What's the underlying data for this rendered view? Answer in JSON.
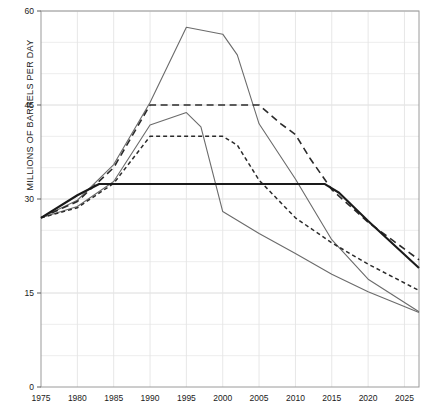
{
  "chart_data": {
    "type": "line",
    "title": "",
    "xlabel": "",
    "ylabel": "MILLIONS OF BARRELS PER DAY",
    "xlim": [
      1975,
      2027
    ],
    "ylim": [
      0,
      60
    ],
    "yticks": [
      0,
      15,
      30,
      45,
      60
    ],
    "ytick_labels": [
      "0",
      "15",
      "30",
      "45",
      "60"
    ],
    "yminor_step": 5,
    "xticks": [
      1975,
      1980,
      1985,
      1990,
      1995,
      2000,
      2005,
      2010,
      2015,
      2020,
      2025
    ],
    "xtick_labels": [
      "1975",
      "1980",
      "1985",
      "1990",
      "1995",
      "2000",
      "2005",
      "2010",
      "2015",
      "2020",
      "2025"
    ],
    "grid": true,
    "legend": "none",
    "units": "million barrels per day",
    "series": [
      {
        "name": "high-solid-peak-1995",
        "style": "solid",
        "color": "#6b6b6b",
        "width": 1.1,
        "x": [
          1975,
          1980,
          1985,
          1990,
          1995,
          2000,
          2002,
          2005,
          2010,
          2015,
          2020,
          2027
        ],
        "y": [
          27.0,
          29.8,
          35.5,
          45.4,
          57.4,
          56.3,
          53.0,
          42.0,
          33.2,
          23.5,
          17.2,
          12.0
        ]
      },
      {
        "name": "upper-dashed-plateau-45",
        "style": "dashed-long",
        "color": "#2b2b2b",
        "width": 1.6,
        "x": [
          1975,
          1980,
          1985,
          1990,
          1995,
          2000,
          2005,
          2008,
          2010,
          2012,
          2015,
          2020,
          2027
        ],
        "y": [
          27.0,
          29.6,
          35.0,
          45.0,
          45.0,
          45.0,
          45.0,
          42.0,
          40.3,
          36.5,
          31.5,
          26.3,
          20.3
        ]
      },
      {
        "name": "mid-solid-peak-1995",
        "style": "solid",
        "color": "#6b6b6b",
        "width": 1.1,
        "x": [
          1975,
          1980,
          1985,
          1990,
          1995,
          1997,
          2000,
          2005,
          2010,
          2015,
          2020,
          2027
        ],
        "y": [
          27.0,
          28.8,
          32.8,
          41.8,
          43.8,
          41.5,
          28.0,
          24.5,
          21.3,
          18.0,
          15.2,
          11.9
        ]
      },
      {
        "name": "lower-dashed-plateau-40",
        "style": "dashed-short",
        "color": "#2b2b2b",
        "width": 1.5,
        "x": [
          1975,
          1980,
          1985,
          1990,
          1995,
          2000,
          2002,
          2005,
          2010,
          2015,
          2020,
          2027
        ],
        "y": [
          27.0,
          28.6,
          32.5,
          40.0,
          40.0,
          40.0,
          38.6,
          33.0,
          27.0,
          23.0,
          19.6,
          15.4
        ]
      },
      {
        "name": "flat-solid-plateau-32",
        "style": "solid-bold",
        "color": "#1a1a1a",
        "width": 2.1,
        "x": [
          1975,
          1980,
          1983,
          2014,
          2016,
          2020,
          2027
        ],
        "y": [
          27.0,
          30.6,
          32.4,
          32.4,
          31.0,
          26.5,
          19.0
        ]
      }
    ]
  },
  "axes": {
    "y_axis_title": "MILLIONS OF BARRELS PER DAY"
  }
}
